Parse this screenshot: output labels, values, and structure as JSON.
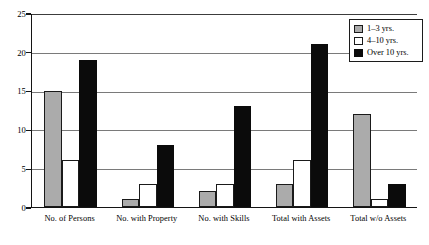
{
  "chart_data": {
    "type": "bar",
    "title": "",
    "subtitle": "",
    "xlabel": "",
    "ylabel": "",
    "ylim": [
      0,
      25
    ],
    "yticks": [
      0,
      5,
      10,
      15,
      20,
      25
    ],
    "ytick_labels": [
      "0",
      "5",
      "10",
      "15",
      "20",
      "25"
    ],
    "grid": true,
    "grid_axis": "y",
    "legend_position": "top-right",
    "categories": [
      "No. of Persons",
      "No. with Property",
      "No. with Skills",
      "Total with Assets",
      "Total w/o Assets"
    ],
    "series": [
      {
        "name": "1–3 yrs.",
        "color": "#ababab",
        "values": [
          15,
          1,
          2,
          3,
          12
        ]
      },
      {
        "name": "4–10 yrs.",
        "color": "#ffffff",
        "values": [
          6,
          3,
          3,
          6,
          1
        ]
      },
      {
        "name": "Over 10 yrs.",
        "color": "#0b0b0b",
        "values": [
          19,
          8,
          13,
          21,
          3
        ]
      }
    ]
  },
  "legend": {
    "items": [
      {
        "label": "1–3 yrs."
      },
      {
        "label": "4–10 yrs."
      },
      {
        "label": "Over 10 yrs."
      }
    ]
  },
  "colors": {
    "series_1_3": "#ababab",
    "series_4_10": "#ffffff",
    "series_over_10": "#0b0b0b",
    "axis": "#141414",
    "gridline": "#7a7a7a",
    "background": "#ffffff"
  }
}
